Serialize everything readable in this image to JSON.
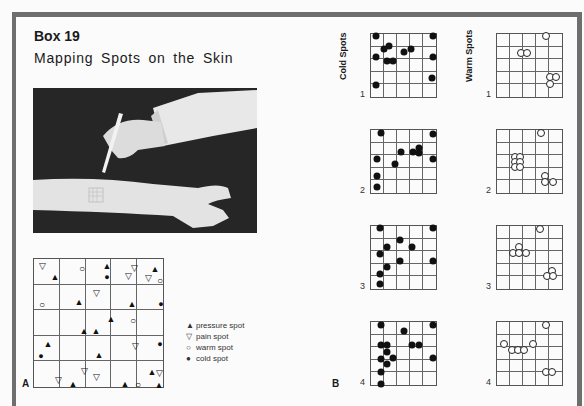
{
  "header": {
    "title": "Box 19",
    "subtitle": "Mapping Spots on the Skin"
  },
  "photo": {
    "description": "hand using a probe to test spots on a forearm with a stamped grid"
  },
  "panel_a": {
    "label": "A",
    "grid": {
      "rows": 5,
      "cols": 5
    },
    "marks": [
      {
        "t": "pain",
        "x": 8,
        "y": 7
      },
      {
        "t": "pressure",
        "x": 21,
        "y": 18
      },
      {
        "t": "warm",
        "x": 48,
        "y": 9
      },
      {
        "t": "pressure",
        "x": 73,
        "y": 7
      },
      {
        "t": "cold",
        "x": 73,
        "y": 18
      },
      {
        "t": "pain",
        "x": 100,
        "y": 9
      },
      {
        "t": "pain",
        "x": 94,
        "y": 17
      },
      {
        "t": "pressure",
        "x": 121,
        "y": 10
      },
      {
        "t": "pain",
        "x": 114,
        "y": 19
      },
      {
        "t": "warm",
        "x": 126,
        "y": 21
      },
      {
        "t": "warm",
        "x": 8,
        "y": 45
      },
      {
        "t": "pressure",
        "x": 45,
        "y": 43
      },
      {
        "t": "pain",
        "x": 62,
        "y": 34
      },
      {
        "t": "pressure",
        "x": 98,
        "y": 45
      },
      {
        "t": "cold",
        "x": 127,
        "y": 45
      },
      {
        "t": "pressure",
        "x": 77,
        "y": 60
      },
      {
        "t": "warm",
        "x": 99,
        "y": 61
      },
      {
        "t": "pressure",
        "x": 50,
        "y": 72
      },
      {
        "t": "pressure",
        "x": 62,
        "y": 72
      },
      {
        "t": "pressure",
        "x": 14,
        "y": 85
      },
      {
        "t": "cold",
        "x": 7,
        "y": 97
      },
      {
        "t": "pain",
        "x": 101,
        "y": 87
      },
      {
        "t": "pressure",
        "x": 65,
        "y": 96
      },
      {
        "t": "cold",
        "x": 126,
        "y": 85
      },
      {
        "t": "pain",
        "x": 50,
        "y": 112
      },
      {
        "t": "pain",
        "x": 24,
        "y": 121
      },
      {
        "t": "pressure",
        "x": 39,
        "y": 125
      },
      {
        "t": "pain",
        "x": 62,
        "y": 118
      },
      {
        "t": "pressure",
        "x": 91,
        "y": 125
      },
      {
        "t": "warm",
        "x": 104,
        "y": 125
      },
      {
        "t": "pressure",
        "x": 118,
        "y": 113
      },
      {
        "t": "pain",
        "x": 125,
        "y": 114
      },
      {
        "t": "pressure",
        "x": 125,
        "y": 126
      }
    ]
  },
  "legend": {
    "items": [
      {
        "symbol": "▲",
        "label": "pressure spot"
      },
      {
        "symbol": "▽",
        "label": "pain spot"
      },
      {
        "symbol": "○",
        "label": "warm spot"
      },
      {
        "symbol": "●",
        "label": "cold spot"
      }
    ]
  },
  "panel_b": {
    "label": "B",
    "cold_label": "Cold Spots",
    "warm_label": "Warm Spots",
    "trials": [
      {
        "n": "1",
        "cold": [
          [
            5,
            2
          ],
          [
            62,
            2
          ],
          [
            18,
            12
          ],
          [
            13,
            15
          ],
          [
            40,
            15
          ],
          [
            33,
            18
          ],
          [
            5,
            23
          ],
          [
            62,
            23
          ],
          [
            16,
            27
          ],
          [
            22,
            27
          ],
          [
            61,
            44
          ],
          [
            5,
            51
          ]
        ],
        "warm": [
          [
            49,
            2
          ],
          [
            24,
            19
          ],
          [
            30,
            19
          ],
          [
            53,
            43
          ],
          [
            59,
            43
          ],
          [
            53,
            50
          ]
        ]
      },
      {
        "n": "2",
        "cold": [
          [
            10,
            3
          ],
          [
            62,
            4
          ],
          [
            30,
            22
          ],
          [
            42,
            22
          ],
          [
            48,
            18
          ],
          [
            48,
            23
          ],
          [
            62,
            29
          ],
          [
            6,
            29
          ],
          [
            24,
            34
          ],
          [
            6,
            46
          ],
          [
            6,
            57
          ]
        ],
        "warm": [
          [
            44,
            3
          ],
          [
            18,
            27
          ],
          [
            23,
            27
          ],
          [
            18,
            32
          ],
          [
            23,
            32
          ],
          [
            18,
            37
          ],
          [
            23,
            37
          ],
          [
            48,
            46
          ],
          [
            48,
            52
          ],
          [
            56,
            52
          ]
        ]
      },
      {
        "n": "3",
        "cold": [
          [
            9,
            2
          ],
          [
            62,
            2
          ],
          [
            29,
            14
          ],
          [
            16,
            21
          ],
          [
            41,
            21
          ],
          [
            9,
            28
          ],
          [
            29,
            35
          ],
          [
            62,
            35
          ],
          [
            16,
            41
          ],
          [
            9,
            48
          ],
          [
            9,
            58
          ]
        ],
        "warm": [
          [
            43,
            3
          ],
          [
            22,
            21
          ],
          [
            16,
            27
          ],
          [
            22,
            27
          ],
          [
            29,
            27
          ],
          [
            55,
            45
          ],
          [
            50,
            50
          ],
          [
            56,
            50
          ]
        ]
      },
      {
        "n": "4",
        "cold": [
          [
            10,
            3
          ],
          [
            62,
            3
          ],
          [
            33,
            9
          ],
          [
            10,
            23
          ],
          [
            16,
            23
          ],
          [
            16,
            30
          ],
          [
            41,
            23
          ],
          [
            48,
            23
          ],
          [
            22,
            36
          ],
          [
            10,
            37
          ],
          [
            62,
            36
          ],
          [
            16,
            42
          ],
          [
            10,
            50
          ],
          [
            10,
            62
          ]
        ],
        "warm": [
          [
            49,
            3
          ],
          [
            7,
            22
          ],
          [
            15,
            28
          ],
          [
            21,
            28
          ],
          [
            27,
            28
          ],
          [
            36,
            22
          ],
          [
            49,
            50
          ],
          [
            55,
            50
          ]
        ]
      }
    ]
  },
  "colors": {
    "frame": "#6e6e6e",
    "ink": "#111111",
    "paper": "#fbfbfb"
  }
}
